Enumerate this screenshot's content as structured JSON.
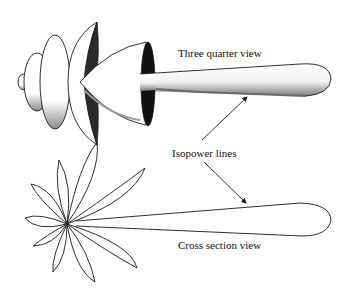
{
  "diagram": {
    "type": "antenna-radiation-pattern",
    "labels": {
      "three_quarter": "Three quarter view",
      "isopower": "Isopower lines",
      "cross_section": "Cross section view"
    },
    "views": [
      {
        "name": "three-quarter-view",
        "description": "3D shaded radiation pattern with stacked side lobes and long main lobe"
      },
      {
        "name": "cross-section-view",
        "description": "2D polar outline with main lobe and petal-shaped side lobes"
      }
    ],
    "arrows": [
      {
        "from": "isopower-label",
        "to": "three-quarter-main-lobe"
      },
      {
        "from": "isopower-label",
        "to": "cross-section-main-lobe"
      }
    ],
    "colors": {
      "stroke": "#1a1a1a",
      "fill": "#ffffff",
      "shadow": "#2a2a2a",
      "shade": "#9a9a9a"
    }
  }
}
